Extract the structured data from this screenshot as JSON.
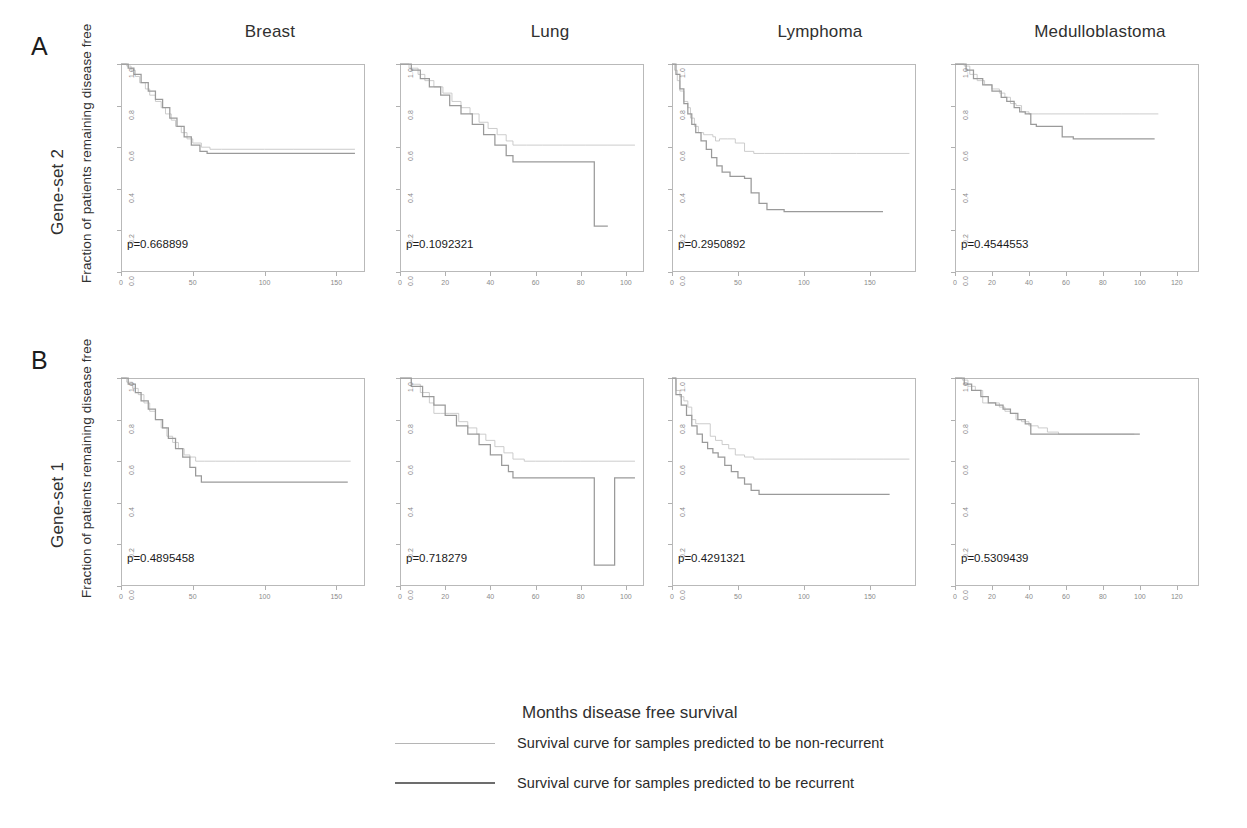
{
  "figure": {
    "x_axis_title": "Months disease free survival",
    "y_axis_label": "Fraction of patients remaining disease free"
  },
  "columns": [
    {
      "label": "Breast"
    },
    {
      "label": "Lung"
    },
    {
      "label": "Lymphoma"
    },
    {
      "label": "Medulloblastoma"
    }
  ],
  "rows": [
    {
      "letter": "A",
      "label": "Gene-set 2"
    },
    {
      "letter": "B",
      "label": "Gene-set 1"
    }
  ],
  "legend": {
    "entries": [
      {
        "style": "thin",
        "label": "Survival curve for samples predicted to be non-recurrent"
      },
      {
        "style": "thick",
        "label": "Survival curve for samples predicted to be recurrent"
      }
    ]
  },
  "chart_data": {
    "type": "line",
    "xlabel": "Months disease free survival",
    "ylabel": "Fraction of patients remaining disease free",
    "ylim": [
      0,
      1
    ],
    "yticks": [
      "0.0",
      "0.2",
      "0.4",
      "0.6",
      "0.8",
      "1.0"
    ],
    "ytick_values": [
      0.0,
      0.2,
      0.4,
      0.6,
      0.8,
      1.0
    ],
    "grid": false,
    "legend_position": "bottom",
    "series_names": [
      "non-recurrent",
      "recurrent"
    ],
    "panels": [
      {
        "row": "A",
        "row_label": "Gene-set 2",
        "column": "Breast",
        "pvalue_text": "p=0.668899",
        "pvalue": 0.668899,
        "xlim": [
          0,
          170
        ],
        "xticks": [
          "0",
          "50",
          "100",
          "150"
        ],
        "xtick_values": [
          0,
          50,
          100,
          150
        ],
        "series": [
          {
            "name": "non-recurrent",
            "x": [
              0,
              4,
              7,
              10,
              13,
              17,
              20,
              24,
              28,
              31,
              35,
              38,
              42,
              46,
              50,
              56,
              62,
              70,
              85,
              100,
              120,
              140,
              163
            ],
            "y": [
              1.0,
              0.99,
              0.97,
              0.94,
              0.91,
              0.88,
              0.85,
              0.82,
              0.79,
              0.76,
              0.73,
              0.7,
              0.67,
              0.64,
              0.62,
              0.6,
              0.59,
              0.59,
              0.59,
              0.59,
              0.59,
              0.59,
              0.59
            ]
          },
          {
            "name": "recurrent",
            "x": [
              0,
              5,
              9,
              14,
              19,
              24,
              29,
              34,
              39,
              44,
              49,
              55,
              60,
              68,
              80,
              95,
              115,
              140,
              163
            ],
            "y": [
              1.0,
              0.98,
              0.95,
              0.91,
              0.87,
              0.83,
              0.79,
              0.74,
              0.7,
              0.65,
              0.61,
              0.58,
              0.57,
              0.57,
              0.57,
              0.57,
              0.57,
              0.57,
              0.57
            ]
          }
        ]
      },
      {
        "row": "A",
        "row_label": "Gene-set 2",
        "column": "Lung",
        "pvalue_text": "p=0.1092321",
        "pvalue": 0.1092321,
        "xlim": [
          0,
          108
        ],
        "xticks": [
          "0",
          "20",
          "40",
          "60",
          "80",
          "100"
        ],
        "xtick_values": [
          0,
          20,
          40,
          60,
          80,
          100
        ],
        "series": [
          {
            "name": "non-recurrent",
            "x": [
              0,
              4,
              8,
              11,
              15,
              19,
              23,
              27,
              31,
              35,
              39,
              43,
              47,
              50,
              56,
              63,
              72,
              82,
              92,
              104
            ],
            "y": [
              1.0,
              0.98,
              0.95,
              0.92,
              0.89,
              0.86,
              0.82,
              0.79,
              0.76,
              0.72,
              0.69,
              0.66,
              0.63,
              0.61,
              0.61,
              0.61,
              0.61,
              0.61,
              0.61,
              0.61
            ]
          },
          {
            "name": "recurrent",
            "x": [
              0,
              5,
              9,
              13,
              18,
              22,
              27,
              32,
              37,
              42,
              47,
              50,
              56,
              62,
              70,
              78,
              86,
              86,
              92
            ],
            "y": [
              1.0,
              0.97,
              0.93,
              0.89,
              0.85,
              0.8,
              0.76,
              0.71,
              0.66,
              0.61,
              0.56,
              0.53,
              0.53,
              0.53,
              0.53,
              0.53,
              0.53,
              0.22,
              0.22
            ]
          }
        ]
      },
      {
        "row": "A",
        "row_label": "Gene-set 2",
        "column": "Lymphoma",
        "pvalue_text": "p=0.2950892",
        "pvalue": 0.2950892,
        "xlim": [
          0,
          185
        ],
        "xticks": [
          "0",
          "50",
          "100",
          "150"
        ],
        "xtick_values": [
          0,
          50,
          100,
          150
        ],
        "series": [
          {
            "name": "non-recurrent",
            "x": [
              0,
              2,
              4,
              6,
              9,
              12,
              14,
              17,
              20,
              24,
              28,
              31,
              33,
              36,
              42,
              48,
              55,
              62,
              70,
              85,
              100,
              120,
              140,
              160,
              180
            ],
            "y": [
              1.0,
              0.97,
              0.92,
              0.87,
              0.82,
              0.79,
              0.74,
              0.7,
              0.67,
              0.66,
              0.66,
              0.65,
              0.63,
              0.64,
              0.64,
              0.62,
              0.58,
              0.57,
              0.57,
              0.57,
              0.57,
              0.57,
              0.57,
              0.57,
              0.57
            ]
          },
          {
            "name": "recurrent",
            "x": [
              0,
              3,
              6,
              9,
              12,
              15,
              18,
              22,
              26,
              30,
              34,
              38,
              44,
              50,
              55,
              60,
              66,
              72,
              85,
              100,
              120,
              140,
              160
            ],
            "y": [
              1.0,
              0.95,
              0.88,
              0.81,
              0.76,
              0.71,
              0.67,
              0.63,
              0.59,
              0.55,
              0.51,
              0.48,
              0.46,
              0.46,
              0.45,
              0.38,
              0.33,
              0.3,
              0.29,
              0.29,
              0.29,
              0.29,
              0.29
            ]
          }
        ]
      },
      {
        "row": "A",
        "row_label": "Gene-set 2",
        "column": "Medulloblastoma",
        "pvalue_text": "p=0.4544553",
        "pvalue": 0.4544553,
        "xlim": [
          0,
          132
        ],
        "xticks": [
          "0",
          "20",
          "40",
          "60",
          "80",
          "100",
          "120"
        ],
        "xtick_values": [
          0,
          20,
          40,
          60,
          80,
          100,
          120
        ],
        "series": [
          {
            "name": "non-recurrent",
            "x": [
              0,
              5,
              8,
              12,
              16,
              20,
              24,
              27,
              30,
              33,
              36,
              40,
              45,
              52,
              60,
              70,
              80,
              90,
              100,
              110
            ],
            "y": [
              1.0,
              0.99,
              0.95,
              0.92,
              0.9,
              0.88,
              0.86,
              0.84,
              0.81,
              0.8,
              0.77,
              0.76,
              0.76,
              0.76,
              0.76,
              0.76,
              0.76,
              0.76,
              0.76,
              0.76
            ]
          },
          {
            "name": "recurrent",
            "x": [
              0,
              6,
              10,
              15,
              20,
              25,
              28,
              32,
              35,
              38,
              41,
              44,
              48,
              52,
              58,
              64,
              70,
              80,
              90,
              100,
              108
            ],
            "y": [
              1.0,
              0.97,
              0.93,
              0.9,
              0.87,
              0.84,
              0.82,
              0.79,
              0.77,
              0.76,
              0.71,
              0.7,
              0.7,
              0.7,
              0.65,
              0.64,
              0.64,
              0.64,
              0.64,
              0.64,
              0.64
            ]
          }
        ]
      },
      {
        "row": "B",
        "row_label": "Gene-set 1",
        "column": "Breast",
        "pvalue_text": "p=0.4895458",
        "pvalue": 0.4895458,
        "xlim": [
          0,
          170
        ],
        "xticks": [
          "0",
          "50",
          "100",
          "150"
        ],
        "xtick_values": [
          0,
          50,
          100,
          150
        ],
        "series": [
          {
            "name": "non-recurrent",
            "x": [
              0,
              4,
              8,
              12,
              16,
              20,
              24,
              28,
              32,
              36,
              40,
              44,
              48,
              52,
              58,
              66,
              80,
              95,
              115,
              140,
              160
            ],
            "y": [
              1.0,
              0.98,
              0.95,
              0.92,
              0.88,
              0.84,
              0.8,
              0.76,
              0.72,
              0.69,
              0.66,
              0.63,
              0.62,
              0.6,
              0.6,
              0.6,
              0.6,
              0.6,
              0.6,
              0.6,
              0.6
            ]
          },
          {
            "name": "recurrent",
            "x": [
              0,
              5,
              10,
              14,
              19,
              24,
              29,
              33,
              38,
              43,
              48,
              52,
              56,
              62,
              72,
              85,
              100,
              120,
              140,
              158
            ],
            "y": [
              1.0,
              0.97,
              0.93,
              0.89,
              0.85,
              0.8,
              0.76,
              0.71,
              0.66,
              0.62,
              0.57,
              0.53,
              0.5,
              0.5,
              0.5,
              0.5,
              0.5,
              0.5,
              0.5,
              0.5
            ]
          }
        ]
      },
      {
        "row": "B",
        "row_label": "Gene-set 1",
        "column": "Lung",
        "pvalue_text": "p=0.718279",
        "pvalue": 0.718279,
        "xlim": [
          0,
          108
        ],
        "xticks": [
          "0",
          "20",
          "40",
          "60",
          "80",
          "100"
        ],
        "xtick_values": [
          0,
          20,
          40,
          60,
          80,
          100
        ],
        "series": [
          {
            "name": "non-recurrent",
            "x": [
              0,
              5,
              9,
              13,
              15,
              18,
              22,
              26,
              30,
              34,
              38,
              42,
              46,
              50,
              55,
              60,
              66,
              72,
              80,
              88,
              96,
              104
            ],
            "y": [
              1.0,
              0.97,
              0.93,
              0.88,
              0.83,
              0.83,
              0.83,
              0.79,
              0.76,
              0.73,
              0.7,
              0.67,
              0.64,
              0.61,
              0.6,
              0.6,
              0.6,
              0.6,
              0.6,
              0.6,
              0.6,
              0.6
            ]
          },
          {
            "name": "recurrent",
            "x": [
              0,
              5,
              10,
              15,
              20,
              25,
              30,
              35,
              40,
              45,
              48,
              50,
              56,
              62,
              70,
              78,
              85,
              86,
              86,
              95,
              104
            ],
            "y": [
              1.0,
              0.96,
              0.91,
              0.87,
              0.82,
              0.77,
              0.73,
              0.68,
              0.63,
              0.58,
              0.55,
              0.52,
              0.52,
              0.52,
              0.52,
              0.52,
              0.52,
              0.52,
              0.1,
              0.52,
              0.52
            ]
          }
        ]
      },
      {
        "row": "B",
        "row_label": "Gene-set 1",
        "column": "Lymphoma",
        "pvalue_text": "p=0.4291321",
        "pvalue": 0.4291321,
        "xlim": [
          0,
          185
        ],
        "xticks": [
          "0",
          "50",
          "100",
          "150"
        ],
        "xtick_values": [
          0,
          50,
          100,
          150
        ],
        "series": [
          {
            "name": "non-recurrent",
            "x": [
              0,
              3,
              6,
              9,
              12,
              15,
              18,
              21,
              25,
              29,
              33,
              38,
              43,
              48,
              55,
              62,
              70,
              85,
              100,
              120,
              140,
              160,
              180
            ],
            "y": [
              1.0,
              0.94,
              0.91,
              0.89,
              0.86,
              0.8,
              0.78,
              0.78,
              0.78,
              0.72,
              0.7,
              0.68,
              0.66,
              0.63,
              0.62,
              0.61,
              0.61,
              0.61,
              0.61,
              0.61,
              0.61,
              0.61,
              0.61
            ]
          },
          {
            "name": "recurrent",
            "x": [
              0,
              3,
              7,
              11,
              15,
              19,
              23,
              27,
              31,
              35,
              40,
              45,
              50,
              55,
              60,
              66,
              72,
              85,
              100,
              120,
              145,
              165
            ],
            "y": [
              1.0,
              0.92,
              0.87,
              0.82,
              0.77,
              0.73,
              0.69,
              0.66,
              0.64,
              0.62,
              0.58,
              0.55,
              0.52,
              0.49,
              0.46,
              0.44,
              0.44,
              0.44,
              0.44,
              0.44,
              0.44,
              0.44
            ]
          }
        ]
      },
      {
        "row": "B",
        "row_label": "Gene-set 1",
        "column": "Medulloblastoma",
        "pvalue_text": "p=0.5309439",
        "pvalue": 0.5309439,
        "xlim": [
          0,
          132
        ],
        "xticks": [
          "0",
          "20",
          "40",
          "60",
          "80",
          "100",
          "120"
        ],
        "xtick_values": [
          0,
          20,
          40,
          60,
          80,
          100,
          120
        ],
        "series": [
          {
            "name": "non-recurrent",
            "x": [
              0,
              4,
              7,
              11,
              15,
              18,
              21,
              24,
              27,
              30,
              33,
              36,
              40,
              45,
              50,
              56,
              62,
              70,
              80,
              90,
              97
            ],
            "y": [
              1.0,
              0.99,
              0.96,
              0.94,
              0.88,
              0.88,
              0.88,
              0.86,
              0.84,
              0.83,
              0.8,
              0.79,
              0.77,
              0.76,
              0.74,
              0.73,
              0.73,
              0.73,
              0.73,
              0.73,
              0.73
            ]
          },
          {
            "name": "recurrent",
            "x": [
              0,
              5,
              9,
              14,
              18,
              22,
              26,
              30,
              34,
              38,
              41,
              46,
              52,
              58,
              64,
              70,
              78,
              86,
              94,
              100
            ],
            "y": [
              1.0,
              0.97,
              0.94,
              0.91,
              0.88,
              0.87,
              0.85,
              0.83,
              0.8,
              0.78,
              0.73,
              0.73,
              0.73,
              0.73,
              0.73,
              0.73,
              0.73,
              0.73,
              0.73,
              0.73
            ]
          }
        ]
      }
    ]
  }
}
